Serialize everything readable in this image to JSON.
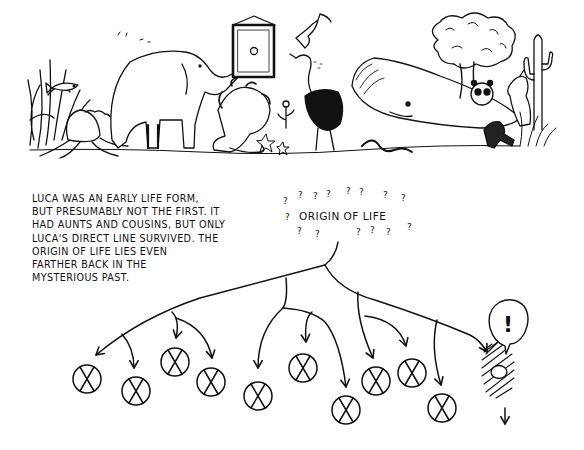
{
  "illustration": {
    "scene_description": "Menagerie of animals looking at a framed picture of a single circle",
    "scene_elements": [
      "seaweed-fish",
      "octopus",
      "elephant",
      "framed-picture",
      "lion",
      "flower",
      "ostrich",
      "bird",
      "whale",
      "snake",
      "starfish",
      "tree",
      "panda",
      "kangaroo",
      "cactus",
      "monkey"
    ]
  },
  "caption": {
    "lines": [
      "LUCA WAS AN EARLY LIFE FORM,",
      "BUT PRESUMABLY NOT THE FIRST. IT",
      "HAD AUNTS AND COUSINS, BUT ONLY",
      "LUCA'S DIRECT LINE SURVIVED. THE",
      "ORIGIN OF LIFE LIES EVEN",
      "FARTHER BACK IN THE",
      "MYSTERIOUS PAST."
    ]
  },
  "tree": {
    "root_label": "ORIGIN OF LIFE",
    "question_mark": "?",
    "extinct_branch_count": 12,
    "surviving_label": "!",
    "surviving_description": "LUCA — the only surviving lineage"
  },
  "colors": {
    "ink": "#111111",
    "paper": "#ffffff"
  }
}
